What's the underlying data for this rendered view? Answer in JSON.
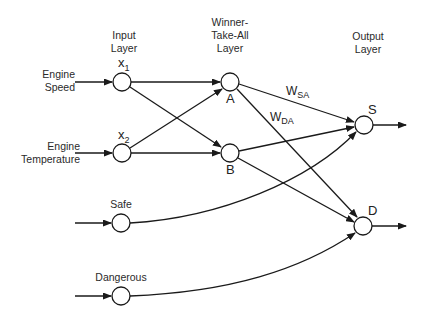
{
  "layers": {
    "input": "Input\nLayer",
    "wta": "Winner-\nTake-All\nLayer",
    "output": "Output\nLayer"
  },
  "inputs": [
    {
      "label": "Engine\nSpeed",
      "node": "x",
      "sub": "1"
    },
    {
      "label": "Engine\nTemperature",
      "node": "x",
      "sub": "2"
    },
    {
      "label": "Safe"
    },
    {
      "label": "Dangerous"
    }
  ],
  "wta_nodes": [
    "A",
    "B"
  ],
  "output_nodes": [
    "S",
    "D"
  ],
  "weights": [
    {
      "w": "W",
      "sub": "SA"
    },
    {
      "w": "W",
      "sub": "DA"
    }
  ]
}
